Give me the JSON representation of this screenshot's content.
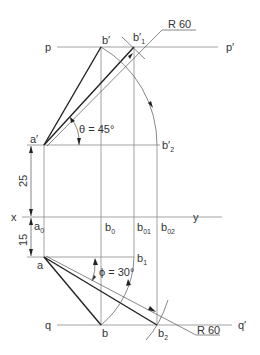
{
  "diagram": {
    "type": "orthographic projection - true length of line by rotation",
    "labels": {
      "p": "p",
      "p_prime": "p′",
      "q": "q",
      "q_prime": "q′",
      "x": "x",
      "y": "y",
      "a_prime": "a′",
      "a": "a",
      "b_prime": "b′",
      "b1_prime_main": "b′",
      "b1_prime_sub": "1",
      "b2_prime_main": "b′",
      "b2_prime_sub": "2",
      "a0_main": "a",
      "a0_sub": "0",
      "b0_main": "b",
      "b0_sub": "0",
      "b01_main": "b",
      "b01_sub": "01",
      "b02_main": "b",
      "b02_sub": "02",
      "b": "b",
      "b1_main": "b",
      "b1_sub": "1",
      "b2_main": "b",
      "b2_sub": "2",
      "theta": "θ = 45°",
      "phi": "ϕ = 30°",
      "r60_top": "R 60",
      "r60_bottom": "R 60",
      "dim_25": "25",
      "dim_15": "15"
    }
  }
}
